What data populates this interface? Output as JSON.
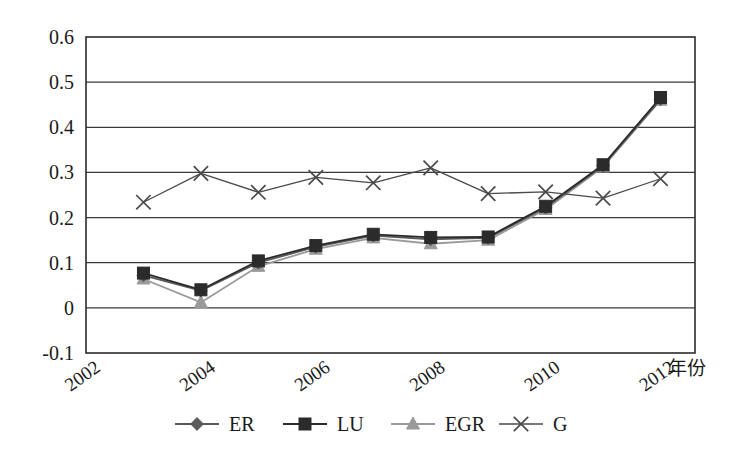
{
  "chart_data": {
    "type": "line",
    "title": "",
    "subtitle": "",
    "xlabel": "年份",
    "ylabel": "",
    "x": [
      2003,
      2004,
      2005,
      2006,
      2007,
      2008,
      2009,
      2010,
      2011,
      2012
    ],
    "xlim": [
      2002,
      2012.6
    ],
    "ylim": [
      -0.1,
      0.6
    ],
    "xticks": [
      2002,
      2004,
      2006,
      2008,
      2010,
      2012
    ],
    "xtick_labels": [
      "2002",
      "2004",
      "2006",
      "2008",
      "2010",
      "2012"
    ],
    "yticks": [
      -0.1,
      0,
      0.1,
      0.2,
      0.3,
      0.4,
      0.5,
      0.6
    ],
    "ytick_labels": [
      "-0.1",
      "0",
      "0.1",
      "0.2",
      "0.3",
      "0.4",
      "0.5",
      "0.6"
    ],
    "grid": "horizontal",
    "legend_position": "bottom",
    "series": [
      {
        "name": "ER",
        "marker": "diamond",
        "color": "#595959",
        "values": [
          0.072,
          0.038,
          0.1,
          0.135,
          0.16,
          0.152,
          0.155,
          0.222,
          0.315,
          0.462
        ]
      },
      {
        "name": "LU",
        "marker": "square",
        "color": "#2b2b2b",
        "values": [
          0.077,
          0.04,
          0.104,
          0.138,
          0.163,
          0.156,
          0.157,
          0.225,
          0.317,
          0.466
        ]
      },
      {
        "name": "EGR",
        "marker": "triangle",
        "color": "#9a9a9a",
        "values": [
          0.064,
          0.012,
          0.092,
          0.13,
          0.155,
          0.142,
          0.15,
          0.218,
          0.312,
          0.46
        ]
      },
      {
        "name": "G",
        "marker": "cross",
        "color": "#4a4a4a",
        "values": [
          0.234,
          0.298,
          0.256,
          0.289,
          0.277,
          0.31,
          0.253,
          0.257,
          0.243,
          0.286
        ]
      }
    ]
  },
  "legend": {
    "items": [
      {
        "label": "ER"
      },
      {
        "label": "LU"
      },
      {
        "label": "EGR"
      },
      {
        "label": "G"
      }
    ]
  },
  "axes": {
    "x_axis_title": "年份"
  }
}
